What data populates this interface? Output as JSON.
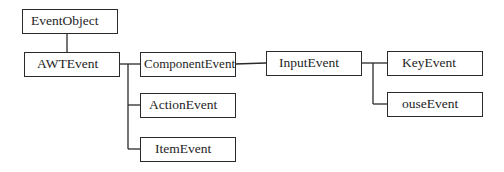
{
  "diagram": {
    "title": "",
    "type": "class-hierarchy",
    "nodes": [
      {
        "id": "eventobject",
        "label": "EventObject"
      },
      {
        "id": "awtevent",
        "label": "AWTEvent"
      },
      {
        "id": "componentevent",
        "label": "ComponentEvent"
      },
      {
        "id": "actionevent",
        "label": "ActionEvent"
      },
      {
        "id": "itemevent",
        "label": "ItemEvent"
      },
      {
        "id": "inputevent",
        "label": "InputEvent"
      },
      {
        "id": "keyevent",
        "label": "KeyEvent"
      },
      {
        "id": "mouseevent",
        "label": "ouseEvent"
      }
    ],
    "edges": [
      {
        "from": "eventobject",
        "to": "awtevent"
      },
      {
        "from": "awtevent",
        "to": "componentevent"
      },
      {
        "from": "awtevent",
        "to": "actionevent"
      },
      {
        "from": "awtevent",
        "to": "itemevent"
      },
      {
        "from": "componentevent",
        "to": "inputevent"
      },
      {
        "from": "inputevent",
        "to": "keyevent"
      },
      {
        "from": "inputevent",
        "to": "mouseevent"
      }
    ],
    "colors": {
      "stroke": "#2a2a2a",
      "text": "#1e1e1e",
      "background": "#ffffff"
    }
  }
}
